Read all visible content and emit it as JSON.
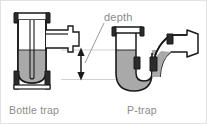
{
  "figure": {
    "title_label": "depth",
    "captions": {
      "left": "Bottle trap",
      "right": "P-trap"
    }
  },
  "colors": {
    "background": "#ffffff",
    "outline": "#1a1a1a",
    "water_fill": "#a9a9a9",
    "body_fill": "#ffffff",
    "fitting_fill": "#4a4a4a",
    "guide_line": "#c9c9c9",
    "text": "#8a8a8a",
    "border": "#e2e2e2"
  },
  "diagram": {
    "type": "cross-section-illustration",
    "items": [
      {
        "name": "bottle-trap",
        "caption": "Bottle trap",
        "water_level_y": 49,
        "trap_bottom_y": 78
      },
      {
        "name": "p-trap",
        "caption": "P-trap",
        "water_level_y": 49,
        "trap_bottom_y": 78
      }
    ],
    "annotation": {
      "label": "depth",
      "arrow": "double-headed-vertical",
      "arrow_top_y": 48,
      "arrow_bottom_y": 78,
      "arrow_x": 80,
      "guide_lines_y": [
        49,
        78
      ]
    }
  }
}
